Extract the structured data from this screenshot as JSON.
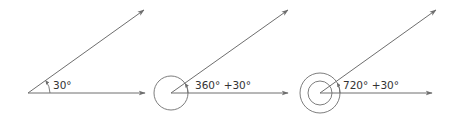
{
  "diagram": {
    "title": "",
    "stroke_color": "#6e6e6e",
    "text_color": "#333333",
    "figures": [
      {
        "id": "angle-30",
        "label": "30°",
        "full_rotations": 0,
        "angle_deg": 30
      },
      {
        "id": "angle-390",
        "label": "360° +30°",
        "full_rotations": 1,
        "angle_deg": 390
      },
      {
        "id": "angle-750",
        "label": "720° +30°",
        "full_rotations": 2,
        "angle_deg": 750
      }
    ]
  }
}
